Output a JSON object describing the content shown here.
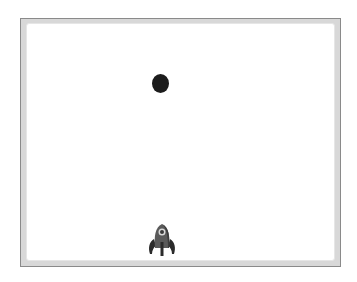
{
  "game": {
    "stage": {
      "background": "#ffffff",
      "border": "#8a8a8a",
      "frame": "#d8d8d8"
    },
    "ball": {
      "x": 160,
      "y": 83,
      "rx": 8,
      "ry": 9,
      "color": "#1c1c1c"
    },
    "player": {
      "sprite": "rocket-ship",
      "x": 162,
      "y": 241,
      "body_color": "#5a5a5a",
      "dark_color": "#2b2b2b",
      "window_color": "#d9d9d9"
    }
  }
}
